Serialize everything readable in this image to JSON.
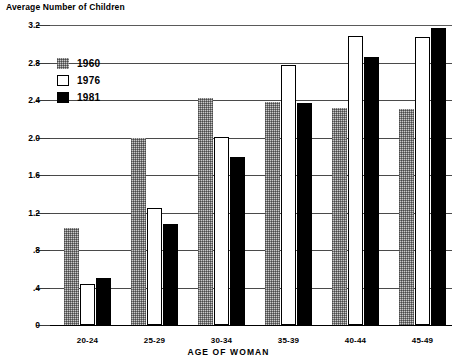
{
  "chart_data": {
    "type": "bar",
    "title": "Average Number of Children",
    "xlabel": "AGE OF WOMAN",
    "ylabel": "Average Number of Children",
    "categories": [
      "20-24",
      "25-29",
      "30-34",
      "35-39",
      "40-44",
      "45-49"
    ],
    "series": [
      {
        "name": "1960",
        "values": [
          1.04,
          2.0,
          2.42,
          2.38,
          2.32,
          2.3
        ],
        "color": "#c9c9c9",
        "fill": "stippled-gray"
      },
      {
        "name": "1976",
        "values": [
          0.44,
          1.25,
          2.01,
          2.77,
          3.08,
          3.07
        ],
        "color": "#ffffff",
        "fill": "white-outlined"
      },
      {
        "name": "1981",
        "values": [
          0.5,
          1.08,
          1.79,
          2.37,
          2.86,
          3.17
        ],
        "color": "#000000",
        "fill": "solid-black"
      }
    ],
    "ylim": [
      0,
      3.2
    ],
    "yticks": [
      0,
      0.4,
      0.8,
      1.2,
      1.6,
      2.0,
      2.4,
      2.8,
      3.2
    ],
    "ytick_labels": [
      "0",
      ".4",
      ".8",
      "1.2",
      "1.6",
      "2.0",
      "2.4",
      "2.8",
      "3.2"
    ],
    "grid": true,
    "grid_axis": "y",
    "legend_position": "upper-left-inside",
    "legend_entries": [
      "1960",
      "1976",
      "1981"
    ]
  },
  "legend": {
    "items": [
      {
        "label": "1960",
        "swatch": "stippled-gray-swatch"
      },
      {
        "label": "1976",
        "swatch": "white-outlined-swatch"
      },
      {
        "label": "1981",
        "swatch": "solid-black-swatch"
      }
    ]
  }
}
